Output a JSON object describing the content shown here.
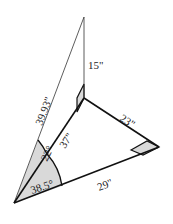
{
  "diagram": {
    "type": "geometry-3d-right-triangles",
    "labels": {
      "hypotenuse_outer": "39.93\"",
      "vertical_edge": "15\"",
      "inner_edge": "37\"",
      "right_edge": "23\"",
      "base_edge": "29\"",
      "angle_upper": "22°",
      "angle_lower": "38.5°"
    },
    "colors": {
      "stroke": "#111111",
      "thin_stroke": "#333333",
      "shade": "#d9d9d9",
      "background": "#ffffff"
    }
  }
}
